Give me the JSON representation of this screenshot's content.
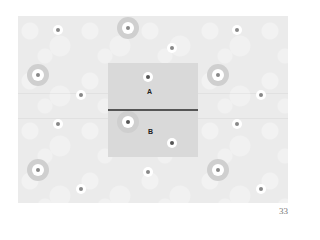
{
  "figure": {
    "labels": {
      "a": "A",
      "b": "B"
    },
    "flowers": [
      {
        "x": 58,
        "y": 30,
        "big": false
      },
      {
        "x": 128,
        "y": 28,
        "big": true
      },
      {
        "x": 237,
        "y": 30,
        "big": false
      },
      {
        "x": 172,
        "y": 48,
        "big": false
      },
      {
        "x": 38,
        "y": 75,
        "big": true
      },
      {
        "x": 148,
        "y": 77,
        "big": false,
        "dark": true
      },
      {
        "x": 218,
        "y": 75,
        "big": true
      },
      {
        "x": 81,
        "y": 95,
        "big": false
      },
      {
        "x": 261,
        "y": 95,
        "big": false
      },
      {
        "x": 58,
        "y": 124,
        "big": false
      },
      {
        "x": 128,
        "y": 122,
        "big": true,
        "dark": true
      },
      {
        "x": 237,
        "y": 124,
        "big": false
      },
      {
        "x": 172,
        "y": 143,
        "big": false,
        "dark": true
      },
      {
        "x": 38,
        "y": 170,
        "big": true
      },
      {
        "x": 148,
        "y": 172,
        "big": false
      },
      {
        "x": 218,
        "y": 170,
        "big": true
      },
      {
        "x": 81,
        "y": 189,
        "big": false
      },
      {
        "x": 261,
        "y": 189,
        "big": false
      }
    ]
  },
  "page_number": "33"
}
